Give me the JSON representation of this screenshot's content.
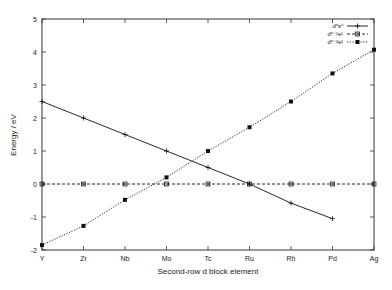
{
  "chart_data": {
    "type": "line",
    "title": "",
    "xlabel": "Second-row d block element",
    "ylabel": "Energy / eV",
    "categories": [
      "Y",
      "Zr",
      "Nb",
      "Mo",
      "Tc",
      "Ru",
      "Rh",
      "Pd",
      "Ag"
    ],
    "ylim": [
      -2,
      5
    ],
    "yticks": [
      -2,
      -1,
      0,
      1,
      2,
      3,
      4,
      5
    ],
    "grid": false,
    "legend_position": "top-right",
    "series": [
      {
        "name": "dⁿs⁰",
        "style": "solid",
        "marker": "plus",
        "values": [
          2.5,
          2.0,
          1.5,
          1.0,
          0.5,
          0.0,
          -0.58,
          -1.05,
          null
        ]
      },
      {
        "name": "dⁿ⁻¹s¹",
        "style": "dashed",
        "marker": "cross-box",
        "values": [
          0.0,
          0.0,
          0.0,
          0.0,
          0.0,
          0.0,
          0.0,
          0.0,
          0.0
        ]
      },
      {
        "name": "dⁿ⁻²s²",
        "style": "dotted",
        "marker": "filled-square",
        "values": [
          -1.85,
          -1.27,
          -0.48,
          0.2,
          1.0,
          1.72,
          2.5,
          3.35,
          4.07
        ]
      }
    ]
  }
}
